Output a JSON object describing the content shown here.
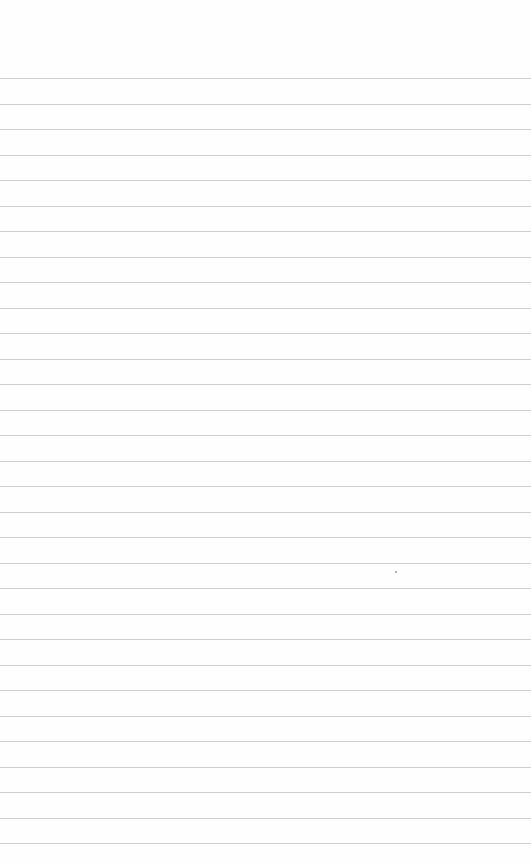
{
  "page": {
    "type": "lined-paper",
    "background_color": "#fefefe",
    "rule_color": "#c8c8c8",
    "rule_count": 31,
    "first_rule_y": 78,
    "rule_spacing": 25.5,
    "speck": {
      "x": 395,
      "y": 571
    }
  }
}
